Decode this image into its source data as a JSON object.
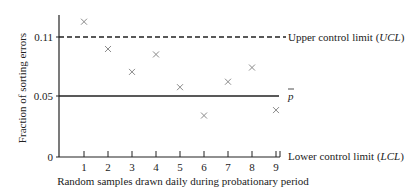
{
  "chart_data": {
    "type": "scatter",
    "title": "",
    "xlabel": "Random samples drawn daily during probationary period",
    "ylabel": "Fraction of sorting errors",
    "x": [
      1,
      2,
      3,
      4,
      5,
      6,
      7,
      8,
      9
    ],
    "series": [
      {
        "name": "Sample fraction of sorting errors",
        "marker": "x",
        "values": [
          0.124,
          0.099,
          0.078,
          0.094,
          0.064,
          0.038,
          0.069,
          0.082,
          0.043
        ]
      }
    ],
    "reference_lines": [
      {
        "name": "Upper control limit (UCL)",
        "value": 0.11,
        "style": "dashed"
      },
      {
        "name": "p-bar",
        "value": 0.05,
        "style": "solid"
      },
      {
        "name": "Lower control limit (LCL)",
        "value": 0,
        "style": "axis"
      }
    ],
    "xticks": [
      "1",
      "2",
      "3",
      "4",
      "5",
      "6",
      "7",
      "8",
      "9"
    ],
    "yticks": [
      "0",
      "0.05",
      "0.11"
    ],
    "ylim": [
      0,
      0.13
    ],
    "xlim": [
      0,
      9.2
    ],
    "grid": false,
    "legend": "right-side line labels"
  },
  "labels": {
    "ylabel": "Fraction of sorting errors",
    "xlabel": "Random samples drawn daily during probationary period",
    "ucl_prefix": "Upper control limit (",
    "ucl_abbr": "UCL",
    "ucl_suffix": ")",
    "pbar": "p",
    "lcl_prefix": "Lower control limit (",
    "lcl_abbr": "LCL",
    "lcl_suffix": ")",
    "ytick_0": "0",
    "ytick_005": "0.05",
    "ytick_011": "0.11"
  },
  "colors": {
    "axis": "#222222",
    "marker": "#8a8a8a",
    "text": "#222222"
  }
}
